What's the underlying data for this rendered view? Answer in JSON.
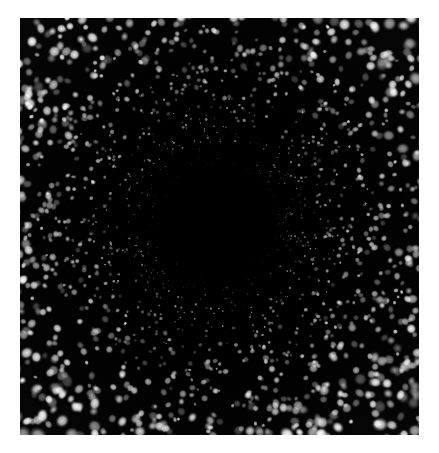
{
  "page": {
    "background_color": "#ffffff",
    "width": 439,
    "height": 453
  },
  "image": {
    "title": "Radial particle scatter field",
    "description": "Dark-field style micrograph: a black square field filled with bright particles arranged radially around a dark circular void at the centre. Particles are tiny, dense and faint near the void and become larger, softer and brighter toward the outer corners.",
    "frame": {
      "left": 20,
      "top": 18,
      "width": 399,
      "height": 417,
      "background_color": "#000000"
    },
    "void": {
      "label": "central-dark-void",
      "center_x": 195,
      "center_y": 203,
      "radius": 44,
      "color": "#000000"
    },
    "particles": {
      "color": "#ffffff",
      "count": 2600,
      "seed": 20240517,
      "size_min": 0.6,
      "size_max": 7.5,
      "blur_min": 0.0,
      "blur_max": 4.2,
      "inner_radius": 44,
      "outer_radius": 300,
      "description": "Size, blur and brightness all scale with distance from the void centre."
    }
  },
  "chart_data": {
    "type": "scatter",
    "xlabel": "",
    "ylabel": "",
    "grid": false,
    "legend": null,
    "xlim": [
      0,
      399
    ],
    "ylim": [
      0,
      417
    ],
    "annotations": [
      "central dark circular void, radius approx 44 px",
      "particle size increases with radius from centre",
      "particle density decreases with radius from centre"
    ],
    "radial_profile": {
      "bins_radius_px": [
        44,
        70,
        100,
        130,
        160,
        190,
        220,
        250,
        280,
        300
      ],
      "mean_particle_diameter_px": [
        0.9,
        1.2,
        1.7,
        2.3,
        3.0,
        3.8,
        4.6,
        5.5,
        6.5,
        7.4
      ],
      "relative_density": [
        1.0,
        0.92,
        0.74,
        0.58,
        0.44,
        0.34,
        0.26,
        0.2,
        0.16,
        0.13
      ],
      "mean_brightness": [
        0.3,
        0.36,
        0.44,
        0.52,
        0.6,
        0.68,
        0.74,
        0.8,
        0.86,
        0.9
      ]
    }
  }
}
